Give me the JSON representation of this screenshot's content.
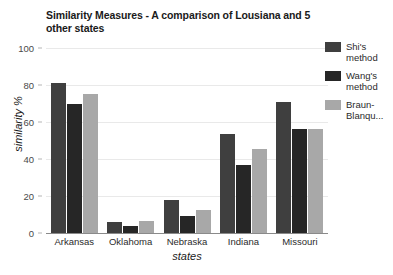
{
  "chart_data": {
    "type": "bar",
    "title": "Similarity Measures - A comparison of Lousiana and 5 other states",
    "xlabel": "states",
    "ylabel": "similarity %",
    "categories": [
      "Arkansas",
      "Oklahoma",
      "Nebraska",
      "Indiana",
      "Missouri"
    ],
    "series": [
      {
        "name": "Shi's method",
        "color": "#3f3f3f",
        "values": [
          81,
          6,
          18,
          53.5,
          71
        ]
      },
      {
        "name": "Wang's method",
        "color": "#262626",
        "values": [
          70,
          4,
          9,
          37,
          56
        ]
      },
      {
        "name": "Braun-Blanqu...",
        "color": "#a8a8a8",
        "values": [
          75,
          6.5,
          12.5,
          45.5,
          56
        ]
      }
    ],
    "ylim": [
      0,
      100
    ],
    "yticks": [
      0,
      20,
      40,
      60,
      80,
      100
    ],
    "ytick_labels": [
      "0",
      "20",
      "40",
      "60",
      "80",
      "100"
    ],
    "grid": true,
    "legend_position": "right",
    "background_color": "#ffffff",
    "gridline_color": "#e9e9e9",
    "axis_color": "#8a8a8a"
  }
}
